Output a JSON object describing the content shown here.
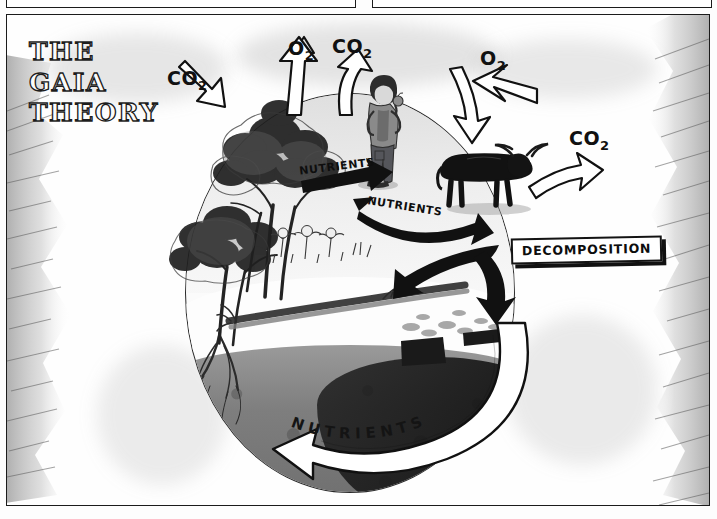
{
  "panel": {
    "title_lines": [
      "THE",
      "GAIA",
      "THEORY"
    ],
    "ink_color": "#1b1b1b",
    "paper_color": "#fdfdfd"
  },
  "labels": {
    "co2_left": "CO",
    "co2_left_sub": "2",
    "o2_tree": "O",
    "o2_tree_sub": "2",
    "co2_man": "CO",
    "co2_man_sub": "2",
    "o2_right": "O",
    "o2_right_sub": "2",
    "co2_right": "CO",
    "co2_right_sub": "2",
    "nutrients_upper": "NUTRIENTS",
    "nutrients_mid": "NUTRIENTS",
    "nutrients_bottom": "NUTRIENTS",
    "decomposition": "DECOMPOSITION"
  },
  "scene": {
    "globe_name": "earth-globe",
    "figures": [
      {
        "name": "tree-upper",
        "kind": "tree"
      },
      {
        "name": "tree-lower",
        "kind": "tree"
      },
      {
        "name": "human-figure",
        "kind": "person"
      },
      {
        "name": "cow-figure",
        "kind": "cow"
      },
      {
        "name": "fallen-log",
        "kind": "deadwood"
      },
      {
        "name": "leaf-litter",
        "kind": "litter"
      }
    ]
  },
  "icons": {
    "arrow_co2_in": "arrow-down-right-icon",
    "arrow_o2_up": "arrow-up-icon",
    "arrow_co2_up": "arrow-up-icon",
    "arrow_o2_intake": "arrow-left-icon",
    "arrow_o2_down": "arrow-down-icon",
    "arrow_co2_out": "arrow-up-right-icon",
    "arrow_nutrients_upper": "arrow-right-icon",
    "arrow_nutrients_mid": "arrow-curve-right-icon",
    "arrow_decomp_a": "arrow-down-left-icon",
    "arrow_decomp_b": "arrow-down-icon",
    "arrow_nutrients_bottom": "arrow-curve-left-icon"
  }
}
